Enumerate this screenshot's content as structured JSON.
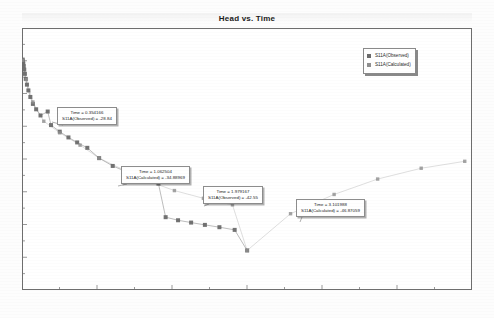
{
  "chart_data": {
    "type": "scatter",
    "title": "Head vs. Time",
    "xlabel": "",
    "ylabel": "",
    "xlim": [
      0,
      6.2
    ],
    "ylim": [
      -52,
      -18
    ],
    "grid": false,
    "legend_position": "top-right",
    "series": [
      {
        "name": "S11A(Observed)",
        "marker": "square",
        "color": "#6b6b6b",
        "points": [
          [
            0.01,
            -22.1
          ],
          [
            0.014,
            -22.35
          ],
          [
            0.018,
            -22.62
          ],
          [
            0.024,
            -22.95
          ],
          [
            0.031,
            -23.4
          ],
          [
            0.04,
            -23.95
          ],
          [
            0.052,
            -24.6
          ],
          [
            0.068,
            -25.35
          ],
          [
            0.088,
            -26.1
          ],
          [
            0.115,
            -26.95
          ],
          [
            0.15,
            -27.85
          ],
          [
            0.195,
            -28.55
          ],
          [
            0.255,
            -29.35
          ],
          [
            0.354,
            -28.84
          ],
          [
            0.4,
            -30.6
          ],
          [
            0.52,
            -31.45
          ],
          [
            0.64,
            -32.2
          ],
          [
            0.76,
            -32.85
          ],
          [
            0.9,
            -33.55
          ],
          [
            1.063,
            -34.89
          ],
          [
            1.25,
            -35.9
          ],
          [
            1.45,
            -36.7
          ],
          [
            1.66,
            -37.45
          ],
          [
            1.88,
            -38.2
          ],
          [
            1.979,
            -42.55
          ],
          [
            2.15,
            -42.95
          ],
          [
            2.33,
            -43.25
          ],
          [
            2.52,
            -43.55
          ],
          [
            2.72,
            -43.85
          ],
          [
            2.93,
            -44.2
          ],
          [
            3.102,
            -46.87
          ]
        ]
      },
      {
        "name": "S11A(Calculated)",
        "marker": "square",
        "color": "#8f8f8f",
        "points": [
          [
            0.01,
            -22.2
          ],
          [
            0.06,
            -24.7
          ],
          [
            0.15,
            -27.6
          ],
          [
            0.3,
            -30.1
          ],
          [
            0.52,
            -31.6
          ],
          [
            0.8,
            -33.2
          ],
          [
            1.063,
            -34.89
          ],
          [
            1.4,
            -36.4
          ],
          [
            1.75,
            -37.9
          ],
          [
            2.1,
            -39.1
          ],
          [
            2.5,
            -40.1
          ],
          [
            2.9,
            -40.95
          ],
          [
            3.102,
            -46.87
          ],
          [
            3.7,
            -42.1
          ],
          [
            4.3,
            -39.6
          ],
          [
            4.9,
            -37.6
          ],
          [
            5.5,
            -36.2
          ],
          [
            6.1,
            -35.3
          ]
        ]
      }
    ],
    "legend": [
      {
        "label": "S11A(Observed)",
        "color": "#6b6b6b"
      },
      {
        "label": "S11A(Calculated)",
        "color": "#8f8f8f"
      }
    ],
    "annotations": [
      {
        "id": "annotation-1",
        "line1": "Time = 0.354166",
        "line2": "S11A(Observed) = -28.84",
        "box_x": 57,
        "box_y": 107,
        "anchor_x": 52,
        "anchor_y": 122
      },
      {
        "id": "annotation-2",
        "line1": "Time = 1.062504",
        "line2": "S11A(Calculated) = -34.88969",
        "box_x": 121,
        "box_y": 166,
        "anchor_x": 118,
        "anchor_y": 186
      },
      {
        "id": "annotation-3",
        "line1": "Time = 1.979167",
        "line2": "S11A(Observed) = -42.55",
        "box_x": 203,
        "box_y": 186,
        "anchor_x": 204,
        "anchor_y": 206
      },
      {
        "id": "annotation-4",
        "line1": "Time = 3.101988",
        "line2": "S11A(Calculated) = -46.87059",
        "box_x": 296,
        "box_y": 199,
        "anchor_x": 300,
        "anchor_y": 222
      }
    ]
  }
}
